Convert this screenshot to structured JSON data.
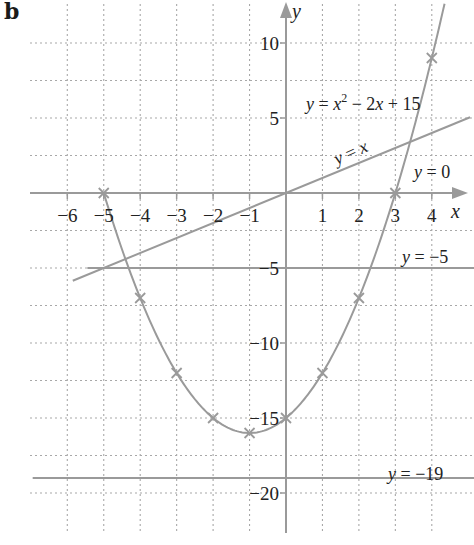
{
  "panel_label": "b",
  "colors": {
    "grid": "#a8a8a8",
    "axis": "#9a9a9a",
    "curve": "#9a9a9a",
    "text": "#222222"
  },
  "chart_data": {
    "type": "line",
    "title": "",
    "xlabel": "x",
    "ylabel": "y",
    "xlim": [
      -6.5,
      5.4
    ],
    "ylim": [
      -22.5,
      12.5
    ],
    "grid": true,
    "grid_x_step": 1,
    "grid_y_step": 2.5,
    "x_ticks": [
      -6,
      -5,
      -4,
      -3,
      -2,
      -1,
      1,
      2,
      3,
      4
    ],
    "x_tick_labels": [
      "−6",
      "−5",
      "−4",
      "−3",
      "−2",
      "−1",
      "1",
      "2",
      "3",
      "4"
    ],
    "y_ticks": [
      10,
      5,
      -5,
      -10,
      -15,
      -20
    ],
    "y_tick_labels": [
      "10",
      "5",
      "−5",
      "−10",
      "−15",
      "−20"
    ],
    "series": [
      {
        "name": "y = x² − 2x + 15",
        "kind": "curve",
        "points": [
          [
            -5,
            0
          ],
          [
            -4,
            -7
          ],
          [
            -3,
            -12
          ],
          [
            -2,
            -15
          ],
          [
            -1,
            -16
          ],
          [
            0,
            -15
          ],
          [
            1,
            -12
          ],
          [
            2,
            -7
          ],
          [
            3,
            0
          ],
          [
            4,
            9
          ]
        ],
        "marked_points": [
          [
            -5,
            0
          ],
          [
            -4,
            -7
          ],
          [
            -3,
            -12
          ],
          [
            -2,
            -15
          ],
          [
            -1,
            -16
          ],
          [
            0,
            -15
          ],
          [
            1,
            -12
          ],
          [
            2,
            -7
          ],
          [
            3,
            0
          ],
          [
            4,
            9
          ]
        ],
        "x_range": [
          -5,
          4.35
        ]
      },
      {
        "name": "y = x",
        "kind": "line",
        "x_range": [
          -5.85,
          5.05
        ]
      },
      {
        "name": "y = 0",
        "kind": "hline",
        "y": 0
      },
      {
        "name": "y = −5",
        "kind": "hline",
        "y": -5,
        "x_range": [
          -5.45,
          5.4
        ]
      },
      {
        "name": "y = −19",
        "kind": "hline",
        "y": -19,
        "x_range": [
          -6.95,
          5.4
        ]
      }
    ],
    "annotations": [
      {
        "text_parts": [
          "y",
          " = ",
          "x",
          "2",
          " − 2",
          "x",
          " + 15"
        ],
        "label": "y = x² − 2x + 15"
      },
      {
        "label": "y = x"
      },
      {
        "label": "y = 0"
      },
      {
        "label": "y = −5"
      },
      {
        "label": "y = −19"
      }
    ]
  },
  "labels": {
    "x_axis": "x",
    "y_axis": "y",
    "curve_eq_y": "y",
    "curve_eq_mid": " = ",
    "curve_eq_x": "x",
    "curve_eq_sup": "2",
    "curve_eq_minus": " − 2",
    "curve_eq_x2": "x",
    "curve_eq_end": " + 15",
    "line_y": "y",
    "line_eq": " = ",
    "line_x": "x",
    "zero_y": "y",
    "zero_rest": " = 0",
    "m5_y": "y",
    "m5_rest": " = −5",
    "m19_y": "y",
    "m19_rest": " = −19"
  }
}
